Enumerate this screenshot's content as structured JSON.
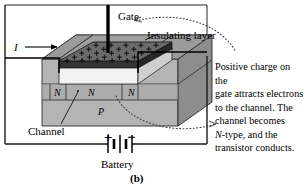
{
  "figure": {
    "panel_label": "(b)",
    "labels": {
      "gate": "Gate",
      "insulating_layer": "Insulating layer",
      "current": "I",
      "n_left": "N",
      "n_middle": "N",
      "n_right": "N",
      "p_substrate": "P",
      "channel": "Channel",
      "battery": "Battery",
      "plus": "+",
      "minus": "−"
    },
    "caption": {
      "line1": "Positive charge on the",
      "line2": "gate attracts electrons",
      "line3": "to the channel. The",
      "line4": "channel becomes",
      "line5_italic": "N",
      "line5_rest": "-type, and the",
      "line6": "transistor conducts."
    },
    "colors": {
      "background": "#ffffff",
      "ink": "#000000",
      "slab_top": "#a9a9a9",
      "slab_front": "#b4b4b4",
      "slab_side": "#8e8e8e",
      "gate_plate": "#6e6e6e",
      "gate_plate_edge": "#3a3a3a",
      "insulator": "#f0f0f0",
      "channel_band": "#9d9d9d",
      "frame": "#1a1a1a"
    },
    "gate_charge_symbol": "+",
    "gate_charge_rows": 5,
    "gate_charge_cols": 5
  }
}
